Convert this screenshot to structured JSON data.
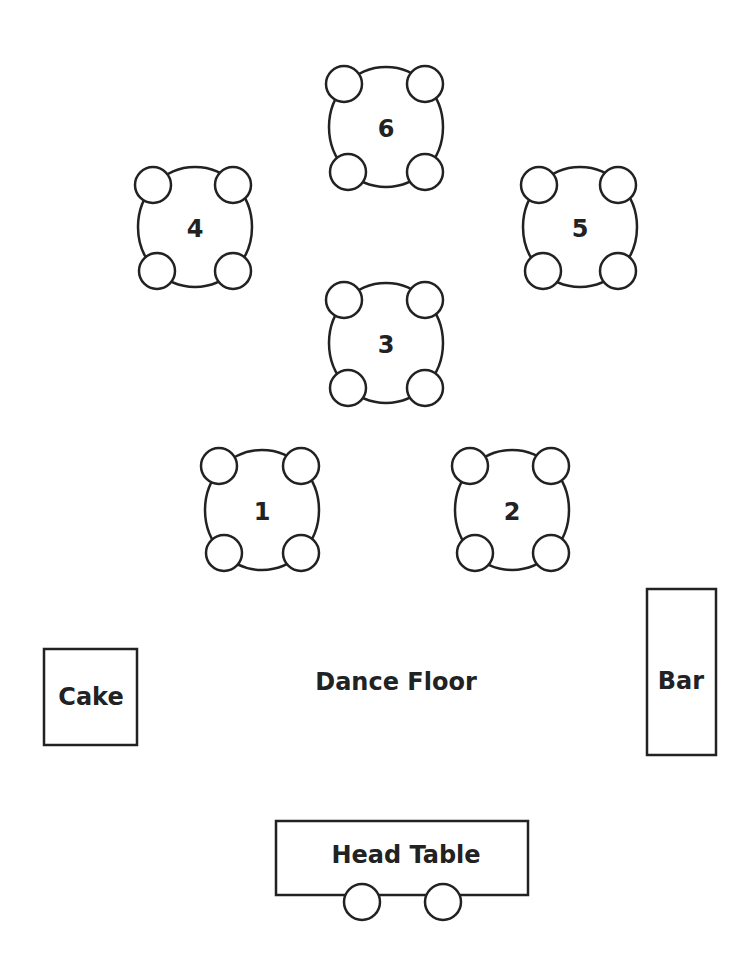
{
  "diagram": {
    "type": "seating-chart",
    "colors": {
      "stroke": "#222222",
      "background": "#ffffff",
      "text": "#222222"
    },
    "tables": [
      {
        "id": "table-6",
        "label": "6",
        "cx": 386,
        "cy": 127,
        "chairs": 4
      },
      {
        "id": "table-4",
        "label": "4",
        "cx": 195,
        "cy": 227,
        "chairs": 4
      },
      {
        "id": "table-5",
        "label": "5",
        "cx": 580,
        "cy": 227,
        "chairs": 4
      },
      {
        "id": "table-3",
        "label": "3",
        "cx": 386,
        "cy": 343,
        "chairs": 4
      },
      {
        "id": "table-1",
        "label": "1",
        "cx": 262,
        "cy": 510,
        "chairs": 4
      },
      {
        "id": "table-2",
        "label": "2",
        "cx": 512,
        "cy": 510,
        "chairs": 4
      }
    ],
    "areas": {
      "cake": {
        "label": "Cake"
      },
      "dance_floor": {
        "label": "Dance Floor"
      },
      "bar": {
        "label": "Bar"
      },
      "head_table": {
        "label": "Head Table",
        "chairs": 2
      }
    }
  }
}
